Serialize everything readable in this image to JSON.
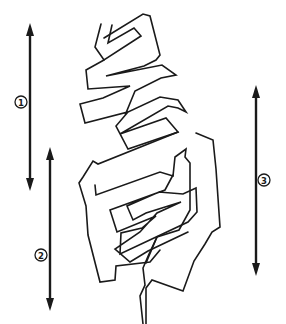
{
  "figure": {
    "type": "anatomical-line-diagram",
    "line_color": "#1a1a1a",
    "background": "#ffffff"
  },
  "arrows": [
    {
      "id": 1,
      "label": "①",
      "number": "1",
      "x": 30,
      "y_top": 23,
      "y_bottom": 190,
      "label_pos": [
        21,
        102
      ]
    },
    {
      "id": 2,
      "label": "②",
      "number": "2",
      "x": 50,
      "y_top": 148,
      "y_bottom": 310,
      "label_pos": [
        41,
        255
      ]
    },
    {
      "id": 3,
      "label": "③",
      "number": "3",
      "x": 256,
      "y_top": 85,
      "y_bottom": 275,
      "label_pos": [
        263,
        180
      ]
    }
  ]
}
